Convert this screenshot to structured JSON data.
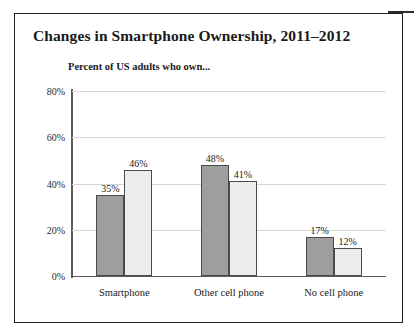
{
  "figure": {
    "title": "Changes in Smartphone Ownership, 2011–2012",
    "subtitle": "Percent of US adults who own..."
  },
  "chart_data": {
    "type": "bar",
    "title": "Changes in Smartphone Ownership, 2011–2012",
    "subtitle": "Percent of US adults who own...",
    "xlabel": "",
    "ylabel": "",
    "ylim": [
      0,
      80
    ],
    "yticks": [
      0,
      20,
      40,
      60,
      80
    ],
    "ytick_labels": [
      "0%",
      "20%",
      "40%",
      "60%",
      "80%"
    ],
    "grid": true,
    "legend": "none",
    "categories": [
      "Smartphone",
      "Other cell phone",
      "No cell phone"
    ],
    "series": [
      {
        "name": "2011",
        "color": "#9e9e9e",
        "values": [
          35,
          48,
          17
        ],
        "labels": [
          "35%",
          "48%",
          "17%"
        ]
      },
      {
        "name": "2012",
        "color": "#ededed",
        "values": [
          46,
          41,
          12
        ],
        "labels": [
          "46%",
          "41%",
          "12%"
        ]
      }
    ]
  }
}
